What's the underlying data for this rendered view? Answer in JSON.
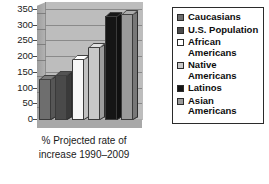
{
  "chart_data": {
    "type": "bar",
    "title": "",
    "xlabel": "% Projected rate of increase 1990–2009",
    "ylabel": "",
    "ylim": [
      0,
      350
    ],
    "yticks": [
      "350",
      "300",
      "250",
      "200",
      "150",
      "100",
      "50",
      "0"
    ],
    "grid": true,
    "legend_position": "right",
    "categories": [
      "Caucasians",
      "U.S. Population",
      "African Americans",
      "Native Americans",
      "Latinos",
      "Asian Americans"
    ],
    "values": [
      135,
      150,
      200,
      240,
      345,
      350
    ],
    "colors": [
      "#6e6e6e",
      "#4a4a4a",
      "#f7f7f7",
      "#c8c8c8",
      "#151515",
      "#9a9a9a"
    ]
  },
  "xaxis": {
    "label_line1": "% Projected rate of",
    "label_line2": "increase 1990–2009"
  },
  "yaxis": {
    "ticks": [
      "350",
      "300",
      "250",
      "200",
      "150",
      "100",
      "50",
      "0"
    ]
  },
  "legend": {
    "items": [
      {
        "label": "Caucasians",
        "label_line2": "",
        "color": "#6e6e6e"
      },
      {
        "label": "U.S. Population",
        "label_line2": "",
        "color": "#4a4a4a"
      },
      {
        "label": "African",
        "label_line2": "Americans",
        "color": "#ffffff"
      },
      {
        "label": "Native",
        "label_line2": "Americans",
        "color": "#c8c8c8"
      },
      {
        "label": "Latinos",
        "label_line2": "",
        "color": "#151515"
      },
      {
        "label": "Asian",
        "label_line2": "Americans",
        "color": "#9a9a9a"
      }
    ]
  }
}
